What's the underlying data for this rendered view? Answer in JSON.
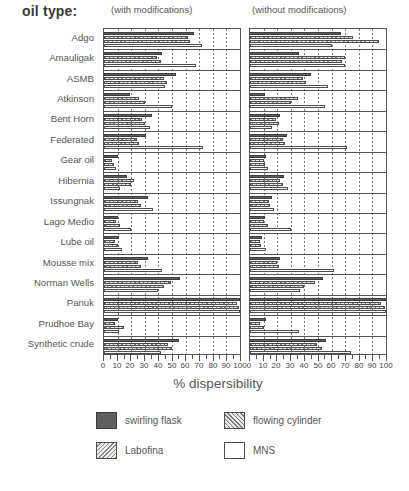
{
  "title_label": "oil type:",
  "panels": [
    {
      "key": "with",
      "caption": "(with modifications)"
    },
    {
      "key": "without",
      "caption": "(without modifications)"
    }
  ],
  "axis": {
    "title": "% dispersibility",
    "ticklabels": [
      "0",
      "10",
      "20",
      "30",
      "40",
      "50",
      "60",
      "70",
      "80",
      "90",
      "100"
    ],
    "min": 0,
    "max": 100
  },
  "legend": [
    {
      "name": "swirling flask",
      "pattern": "swirling"
    },
    {
      "name": "flowing cylinder",
      "pattern": "flowing"
    },
    {
      "name": "Labofina",
      "pattern": "labofina"
    },
    {
      "name": "MNS",
      "pattern": "mns"
    }
  ],
  "chart_data": {
    "type": "bar",
    "orientation": "horizontal",
    "title": "",
    "xlabel": "% dispersibility",
    "ylabel": "oil type",
    "xlim": [
      0,
      100
    ],
    "grid": true,
    "legend_position": "bottom",
    "categories": [
      "Adgo",
      "Amauligak",
      "ASMB",
      "Atkinson",
      "Bent Horn",
      "Federated",
      "Gear oil",
      "Hibernia",
      "Issungnak",
      "Lago Medio",
      "Lube oil",
      "Mousse mix",
      "Norman Wells",
      "Panuk",
      "Prudhoe Bay",
      "Synthetic crude"
    ],
    "series_names": [
      "swirling flask",
      "flowing cylinder",
      "Labofina",
      "MNS"
    ],
    "panels": {
      "with_modifications": {
        "label": "(with modifications)",
        "series": [
          {
            "name": "swirling flask",
            "values": [
              66,
              43,
              53,
              19,
              35,
              31,
              10,
              17,
              32,
              10,
              11,
              32,
              56,
              100,
              10,
              55
            ]
          },
          {
            "name": "flowing cylinder",
            "values": [
              62,
              39,
              44,
              26,
              28,
              24,
              6,
              22,
              25,
              9,
              8,
              25,
              49,
              98,
              8,
              47
            ]
          },
          {
            "name": "Labofina",
            "values": [
              63,
              42,
              46,
              30,
              30,
              26,
              7,
              20,
              27,
              12,
              10,
              27,
              44,
              99,
              15,
              50
            ]
          },
          {
            "name": "MNS",
            "values": [
              72,
              68,
              45,
              50,
              34,
              73,
              9,
              12,
              36,
              20,
              13,
              43,
              40,
              100,
              11,
              42
            ]
          }
        ]
      },
      "without_modifications": {
        "label": "(without modifications)",
        "series": [
          {
            "name": "swirling flask",
            "values": [
              67,
              36,
              45,
              11,
              22,
              27,
              12,
              25,
              16,
              11,
              9,
              22,
              54,
              100,
              12,
              56
            ]
          },
          {
            "name": "flowing cylinder",
            "values": [
              76,
              70,
              39,
              35,
              19,
              24,
              10,
              22,
              14,
              10,
              7,
              20,
              48,
              96,
              7,
              49
            ]
          },
          {
            "name": "Labofina",
            "values": [
              95,
              68,
              41,
              30,
              21,
              26,
              11,
              24,
              15,
              13,
              8,
              21,
              40,
              99,
              10,
              53
            ]
          },
          {
            "name": "MNS",
            "values": [
              60,
              70,
              57,
              55,
              16,
              71,
              13,
              28,
              18,
              30,
              12,
              62,
              37,
              100,
              36,
              74
            ]
          }
        ]
      }
    }
  }
}
